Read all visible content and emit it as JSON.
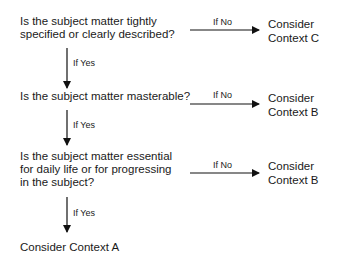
{
  "diagram": {
    "questions": [
      {
        "lines": [
          "Is the subject matter tightly",
          "specified or clearly described?"
        ]
      },
      {
        "lines": [
          "Is the subject matter masterable?"
        ]
      },
      {
        "lines": [
          "Is the subject matter essential",
          "for daily life or for progressing",
          "in the subject?"
        ]
      }
    ],
    "no_label": "If No",
    "yes_label": "If Yes",
    "outcomes_no": [
      {
        "lines": [
          "Consider",
          "Context C"
        ]
      },
      {
        "lines": [
          "Consider",
          "Context B"
        ]
      },
      {
        "lines": [
          "Consider",
          "Context B"
        ]
      }
    ],
    "final_outcome": "Consider Context A"
  }
}
